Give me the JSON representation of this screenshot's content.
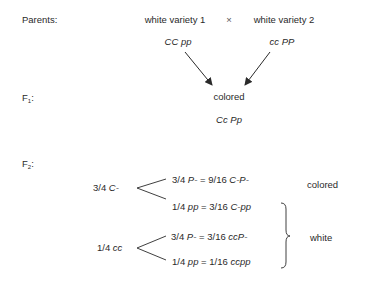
{
  "labels": {
    "parents": "Parents:",
    "f1_prefix": "F",
    "f1_sub": "1",
    "f2_prefix": "F",
    "f2_sub": "2",
    "colon": ":"
  },
  "parents": {
    "left": {
      "name": "white variety 1",
      "genotype": "CC pp"
    },
    "cross_symbol": "×",
    "right": {
      "name": "white variety 2",
      "genotype": "cc PP"
    }
  },
  "f1": {
    "phenotype": "colored",
    "genotype": "Cc Pp"
  },
  "f2": {
    "groups": [
      {
        "frac": "3/4",
        "allele": "C-",
        "branches": [
          {
            "frac": "3/4",
            "allele": "P-",
            "eq": "=",
            "result_frac": "9/16",
            "result_geno": "C-P-"
          },
          {
            "frac": "1/4",
            "allele": "pp",
            "eq": "=",
            "result_frac": "3/16",
            "result_geno": "C-pp"
          }
        ]
      },
      {
        "frac": "1/4",
        "allele": "cc",
        "branches": [
          {
            "frac": "3/4",
            "allele": "P-",
            "eq": "=",
            "result_frac": "3/16",
            "result_geno": "ccP-"
          },
          {
            "frac": "1/4",
            "allele": "pp",
            "eq": "=",
            "result_frac": "1/16",
            "result_geno": "ccpp"
          }
        ]
      }
    ],
    "phenotypes": {
      "colored": "colored",
      "white": "white"
    }
  }
}
